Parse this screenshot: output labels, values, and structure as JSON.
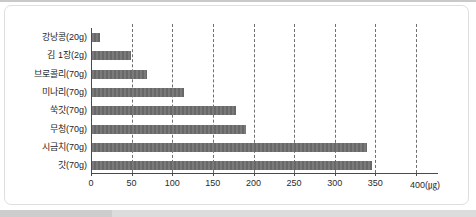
{
  "chart_data": {
    "type": "bar",
    "orientation": "horizontal",
    "title": "",
    "xlabel": "",
    "ylabel": "",
    "unit_label": "(㎍)",
    "categories": [
      "강낭콩(20g)",
      "김 1장(2g)",
      "브로콜리(70g)",
      "미나리(70g)",
      "쑥갓(70g)",
      "무청(70g)",
      "시금치(70g)",
      "갓(70g)"
    ],
    "values": [
      10,
      48,
      68,
      113,
      177,
      190,
      338,
      345
    ],
    "x_ticks": [
      0,
      50,
      100,
      150,
      200,
      250,
      300,
      350,
      400
    ],
    "xlim": [
      0,
      400
    ],
    "grid": "vertical-dashed",
    "legend": "none",
    "bar_color": "#6e6e6e"
  },
  "frame": {
    "border_color": "#dedede",
    "page_rule_color": "#c9c9c9",
    "bottom_band_color": "#dcdcdc"
  }
}
